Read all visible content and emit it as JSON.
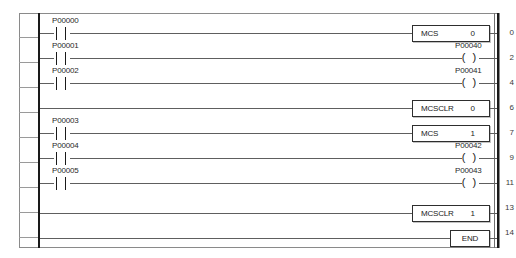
{
  "document": {
    "title": "Ladder Logic Diagram",
    "type": "plc-ladder-program",
    "background_color": "#ffffff",
    "frame_color": "#8a8a8a",
    "rail_color": "#1a1a1a",
    "wire_color": "#5e5e5e"
  },
  "rungs": [
    {
      "number": "0",
      "contact": {
        "label": "P00000",
        "type": "normally-open"
      },
      "output": {
        "kind": "block",
        "name": "MCS",
        "operand": "0"
      }
    },
    {
      "number": "2",
      "contact": {
        "label": "P00001",
        "type": "normally-open"
      },
      "output": {
        "kind": "coil",
        "label": "P00040",
        "symbol": "( )"
      }
    },
    {
      "number": "4",
      "contact": {
        "label": "P00002",
        "type": "normally-open"
      },
      "output": {
        "kind": "coil",
        "label": "P00041",
        "symbol": "( )"
      }
    },
    {
      "number": "6",
      "contact": null,
      "output": {
        "kind": "block",
        "name": "MCSCLR",
        "operand": "0"
      }
    },
    {
      "number": "7",
      "contact": {
        "label": "P00003",
        "type": "normally-open"
      },
      "output": {
        "kind": "block",
        "name": "MCS",
        "operand": "1"
      }
    },
    {
      "number": "9",
      "contact": {
        "label": "P00004",
        "type": "normally-open"
      },
      "output": {
        "kind": "coil",
        "label": "P00042",
        "symbol": "( )"
      }
    },
    {
      "number": "11",
      "contact": {
        "label": "P00005",
        "type": "normally-open"
      },
      "output": {
        "kind": "coil",
        "label": "P00043",
        "symbol": "( )"
      }
    },
    {
      "number": "13",
      "contact": null,
      "output": {
        "kind": "block",
        "name": "MCSCLR",
        "operand": "1"
      }
    },
    {
      "number": "14",
      "contact": null,
      "output": {
        "kind": "block",
        "name": "END",
        "operand": ""
      }
    }
  ]
}
